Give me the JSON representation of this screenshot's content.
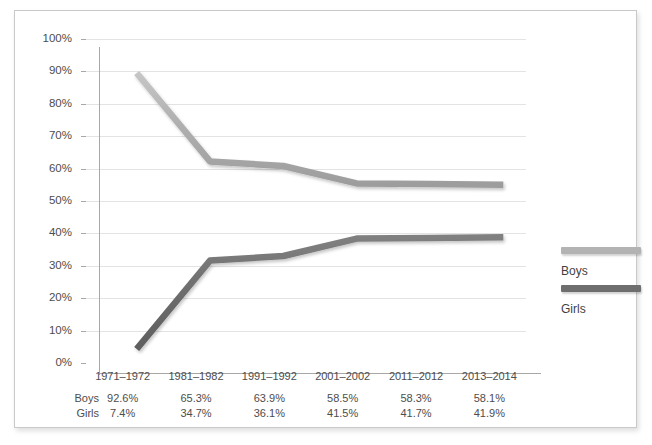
{
  "chart_data": {
    "type": "line",
    "title": "",
    "xlabel": "",
    "ylabel": "",
    "ylim": [
      0,
      100
    ],
    "grid": true,
    "legend_position": "right",
    "categories": [
      "1971–1972",
      "1981–1982",
      "1991–1992",
      "2001–2002",
      "2011–2012",
      "2013–2014"
    ],
    "series": [
      {
        "name": "Boys",
        "color": "#b3b3b3",
        "values": [
          92.6,
          65.3,
          63.9,
          58.5,
          58.3,
          58.1
        ],
        "labels": [
          "92.6%",
          "65.3%",
          "63.9%",
          "58.5%",
          "58.3%",
          "58.1%"
        ]
      },
      {
        "name": "Girls",
        "color": "#6e6e6e",
        "values": [
          7.4,
          34.7,
          36.1,
          41.5,
          41.7,
          41.9
        ],
        "labels": [
          "7.4%",
          "34.7%",
          "36.1%",
          "41.5%",
          "41.7%",
          "41.9%"
        ]
      }
    ],
    "y_ticks": [
      "0%",
      "10%",
      "20%",
      "30%",
      "40%",
      "50%",
      "60%",
      "70%",
      "80%",
      "90%",
      "100%"
    ],
    "y_tick_values": [
      0,
      10,
      20,
      30,
      40,
      50,
      60,
      70,
      80,
      90,
      100
    ]
  },
  "legend": {
    "entries": [
      {
        "label": "Boys",
        "color": "#b3b3b3"
      },
      {
        "label": "Girls",
        "color": "#6e6e6e"
      }
    ]
  },
  "data_table": {
    "row_labels": [
      "Boys",
      "Girls"
    ],
    "rows": [
      [
        "92.6%",
        "65.3%",
        "63.9%",
        "58.5%",
        "58.3%",
        "58.1%"
      ],
      [
        "7.4%",
        "34.7%",
        "36.1%",
        "41.5%",
        "41.7%",
        "41.9%"
      ]
    ]
  },
  "colors": {
    "boys_line": "#b3b3b3",
    "girls_line": "#6e6e6e",
    "gridline": "#e3e3e3",
    "axis": "#a8a8a8",
    "text": "#4d4d4d",
    "frame_border": "#c9c9c9",
    "background": "#ffffff"
  }
}
